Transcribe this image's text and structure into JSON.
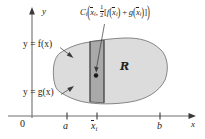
{
  "figure": {
    "type": "calculus-region-diagram",
    "axes": {
      "x_label": "x",
      "y_label": "y",
      "origin_label": "0"
    },
    "curve_labels": {
      "upper": "y = f(x)",
      "lower": "y = g(x)"
    },
    "region_label": "R",
    "x_ticks": [
      {
        "id": "a",
        "label": "a",
        "x_px": 67
      },
      {
        "id": "xbar",
        "label": "x",
        "sub": "i",
        "overbar": true,
        "x_px": 97
      },
      {
        "id": "b",
        "label": "b",
        "x_px": 160
      }
    ],
    "centroid_label": {
      "name": "C",
      "name_sub": "i",
      "arg1_base": "x",
      "arg1_sub": "i",
      "fraction_num": "1",
      "fraction_den": "2",
      "bracket_open": "[",
      "term1_fn": "f",
      "term1_base": "x",
      "term1_sub": "i",
      "plus": "+",
      "term2_fn": "g",
      "term2_base": "x",
      "term2_sub": "i",
      "bracket_close": "]",
      "comma": ",",
      "paren_open": "(",
      "paren_close": ")"
    },
    "colors": {
      "region_fill": "#dcdcdc",
      "strip_fill": "#a9a9a9",
      "stroke": "#231f20",
      "axis": "#6e6e6e",
      "background": "#ffffff"
    },
    "strip": {
      "center_x_px": 97,
      "width_px": 14
    },
    "centroid_point": {
      "x_px": 96,
      "y_px": 74
    }
  }
}
